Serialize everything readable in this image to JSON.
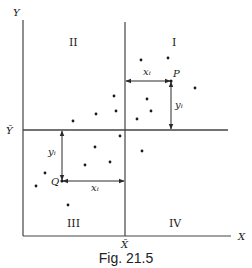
{
  "diagram": {
    "caption": "Fig. 21.5",
    "axes": {
      "y_label": "Y",
      "x_label": "X",
      "y_mean_label": "Ȳ",
      "x_mean_label": "X̄"
    },
    "quadrants": {
      "q1": "I",
      "q2": "II",
      "q3": "III",
      "q4": "IV"
    },
    "annotations": {
      "point_p": "P",
      "point_q": "Q",
      "p_xi": "xᵢ",
      "p_yi": "yᵢ",
      "q_xi": "xᵢ",
      "q_yi": "yᵢ"
    },
    "colors": {
      "line": "#3a3a3a",
      "text": "#1a1a1a",
      "background": "#ffffff"
    }
  }
}
